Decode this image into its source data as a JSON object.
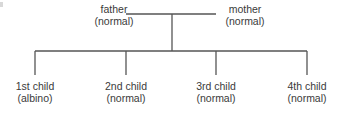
{
  "diagram": {
    "type": "pedigree",
    "line_color": "#555555",
    "text_color": "#3a3a3a",
    "parents": [
      {
        "id": "father",
        "name": "father",
        "phenotype": "(normal)"
      },
      {
        "id": "mother",
        "name": "mother",
        "phenotype": "(normal)"
      }
    ],
    "children": [
      {
        "id": "child1",
        "name": "1st child",
        "phenotype": "(albino)"
      },
      {
        "id": "child2",
        "name": "2nd child",
        "phenotype": "(normal)"
      },
      {
        "id": "child3",
        "name": "3rd child",
        "phenotype": "(normal)"
      },
      {
        "id": "child4",
        "name": "4th child",
        "phenotype": "(normal)"
      }
    ]
  }
}
